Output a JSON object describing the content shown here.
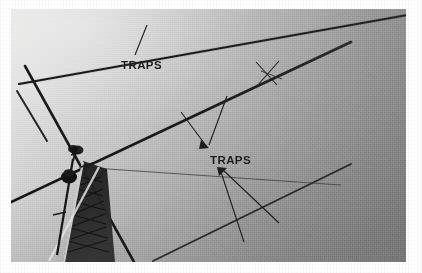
{
  "figure": {
    "kind": "scanned-photograph",
    "border_color": "#ffffff",
    "sky_light": "#e4e4e2",
    "sky_dark": "#828282",
    "ink_color": "#1a1a1a",
    "frame": {
      "x": 11,
      "y": 9,
      "width": 395,
      "height": 253
    }
  },
  "annotations": [
    {
      "id": "traps-upper",
      "label": "TRAPS",
      "x": 110,
      "y": 50,
      "points_to": "upper-reflector-element-trap"
    },
    {
      "id": "traps-lower",
      "label": "TRAPS",
      "x": 199,
      "y": 145,
      "points_to": "driven-and-director-element-traps"
    }
  ],
  "antenna": {
    "parts": [
      {
        "name": "upper-element",
        "type": "element"
      },
      {
        "name": "middle-boom-element",
        "type": "element"
      },
      {
        "name": "lower-element",
        "type": "element"
      },
      {
        "name": "vertical-element",
        "type": "element"
      },
      {
        "name": "tower",
        "type": "lattice-mast"
      },
      {
        "name": "rotator",
        "type": "rotator"
      },
      {
        "name": "trap-marker-upper-right",
        "type": "trap"
      }
    ]
  },
  "colors": {
    "ink": "#1a1a1a",
    "paper": "#ffffff",
    "sky_top_left": "#e4e4e2",
    "sky_bottom_right": "#828282",
    "tower_dark": "#262626"
  }
}
